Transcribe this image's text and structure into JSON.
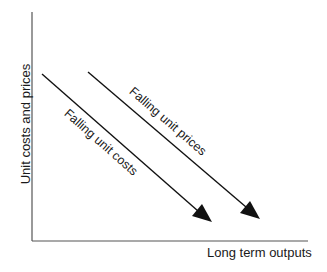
{
  "diagram": {
    "axes": {
      "x_label": "Long term outputs",
      "y_label": "Unit costs and prices"
    },
    "curves": [
      {
        "name": "costs",
        "label": "Falling unit costs",
        "direction": "downward"
      },
      {
        "name": "prices",
        "label": "Falling unit prices",
        "direction": "downward"
      }
    ],
    "colors": {
      "line": "#111111",
      "axis": "#444444",
      "text": "#1a1a1a",
      "background": "#ffffff"
    }
  }
}
